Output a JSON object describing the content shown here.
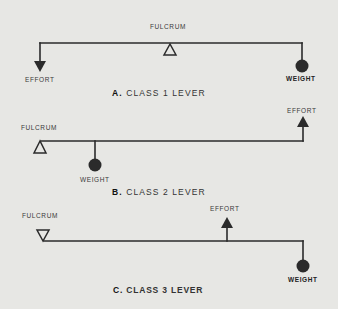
{
  "diagram": {
    "levers": [
      {
        "id": "A",
        "title_letter": "A.",
        "title_text": "CLASS 1 LEVER",
        "fulcrum_label": "FULCRUM",
        "effort_label": "EFFORT",
        "weight_label": "WEIGHT",
        "arrangement": "fulcrum between effort and weight"
      },
      {
        "id": "B",
        "title_letter": "B.",
        "title_text": "CLASS 2 LEVER",
        "fulcrum_label": "FULCRUM",
        "effort_label": "EFFORT",
        "weight_label": "WEIGHT",
        "arrangement": "weight between fulcrum and effort"
      },
      {
        "id": "C",
        "title_letter": "C.",
        "title_text": "CLASS 3 LEVER",
        "fulcrum_label": "FULCRUM",
        "effort_label": "EFFORT",
        "weight_label": "WEIGHT",
        "arrangement": "effort between fulcrum and weight"
      }
    ]
  },
  "colors": {
    "background": "#e7e7e4",
    "ink": "#2b2b2b"
  }
}
